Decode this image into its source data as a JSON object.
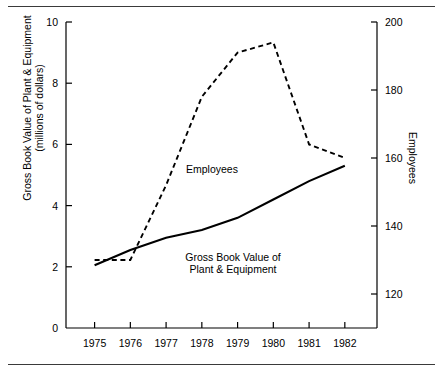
{
  "figure": {
    "background": "#ffffff",
    "foreground": "#000000",
    "rule_color": "#3a3a3a"
  },
  "chart_data": {
    "type": "line",
    "title": "",
    "xlabel": "",
    "ylabel": "Gross Book Value of Plant & Equipment\n(millions of dollars)",
    "y2label": "Employees",
    "grid": false,
    "legend": "inline-annotations",
    "x": [
      1975,
      1976,
      1977,
      1978,
      1979,
      1980,
      1981,
      1982
    ],
    "xlim": [
      1974.2,
      1982.9
    ],
    "xticks": [
      1975,
      1976,
      1977,
      1978,
      1979,
      1980,
      1981,
      1982
    ],
    "xticklabels": [
      "1975",
      "1976",
      "1977",
      "1978",
      "1979",
      "1980",
      "1981",
      "1982"
    ],
    "ylim": [
      0,
      10
    ],
    "yticks": [
      0,
      2,
      4,
      6,
      8,
      10
    ],
    "yticklabels": [
      "0",
      "2",
      "4",
      "6",
      "8",
      "10"
    ],
    "y2lim": [
      110,
      200
    ],
    "y2ticks": [
      120,
      140,
      160,
      180,
      200
    ],
    "y2ticklabels": [
      "120",
      "140",
      "160",
      "180",
      "200"
    ],
    "series": [
      {
        "name": "Gross Book Value of Plant & Equipment",
        "axis": "left",
        "style": "solid",
        "color": "#000000",
        "label_text": "Gross Book Value of\nPlant & Equipment",
        "values": [
          2.05,
          2.55,
          2.95,
          3.2,
          3.6,
          4.2,
          4.8,
          5.3
        ]
      },
      {
        "name": "Employees",
        "axis": "right",
        "style": "dashed",
        "color": "#000000",
        "label_text": "Employees",
        "values": [
          130,
          130,
          152,
          178,
          191,
          194,
          164,
          160
        ]
      }
    ]
  }
}
